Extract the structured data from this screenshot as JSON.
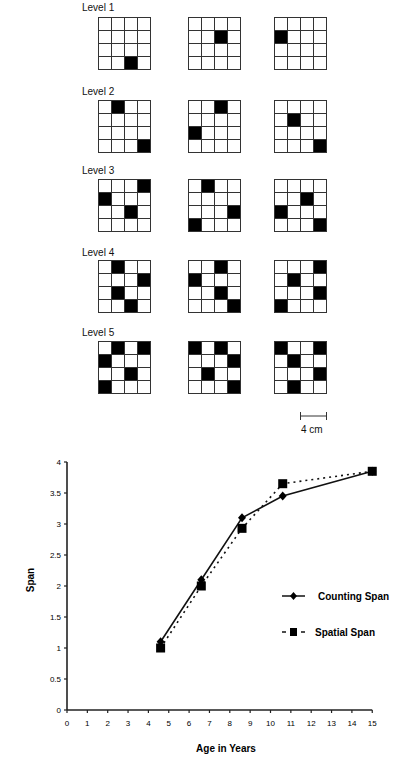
{
  "figure": {
    "grid_size": 4,
    "levels": [
      {
        "label": "Level  1",
        "label_y": 2,
        "grid_y": 17,
        "grids": [
          [
            [
              3,
              2
            ]
          ],
          [
            [
              1,
              2
            ]
          ],
          [
            [
              1,
              0
            ]
          ]
        ]
      },
      {
        "label": "Level  2",
        "label_y": 86,
        "grid_y": 100,
        "grids": [
          [
            [
              0,
              1
            ],
            [
              3,
              3
            ]
          ],
          [
            [
              0,
              2
            ],
            [
              2,
              0
            ]
          ],
          [
            [
              1,
              1
            ],
            [
              3,
              3
            ]
          ]
        ]
      },
      {
        "label": "Level  3",
        "label_y": 165,
        "grid_y": 179,
        "grids": [
          [
            [
              0,
              3
            ],
            [
              1,
              0
            ],
            [
              2,
              2
            ]
          ],
          [
            [
              0,
              1
            ],
            [
              2,
              3
            ],
            [
              3,
              0
            ]
          ],
          [
            [
              1,
              2
            ],
            [
              2,
              0
            ],
            [
              3,
              3
            ]
          ]
        ]
      },
      {
        "label": "Level  4",
        "label_y": 247,
        "grid_y": 260,
        "grids": [
          [
            [
              0,
              1
            ],
            [
              1,
              3
            ],
            [
              2,
              1
            ],
            [
              3,
              2
            ]
          ],
          [
            [
              0,
              2
            ],
            [
              1,
              0
            ],
            [
              2,
              2
            ],
            [
              3,
              3
            ]
          ],
          [
            [
              0,
              3
            ],
            [
              1,
              1
            ],
            [
              2,
              3
            ],
            [
              3,
              0
            ]
          ]
        ]
      },
      {
        "label": "Level  5",
        "label_y": 327,
        "grid_y": 341,
        "grids": [
          [
            [
              0,
              1
            ],
            [
              0,
              3
            ],
            [
              1,
              0
            ],
            [
              2,
              2
            ],
            [
              3,
              0
            ]
          ],
          [
            [
              0,
              0
            ],
            [
              0,
              2
            ],
            [
              1,
              3
            ],
            [
              2,
              1
            ],
            [
              3,
              3
            ]
          ],
          [
            [
              0,
              0
            ],
            [
              0,
              3
            ],
            [
              1,
              1
            ],
            [
              2,
              3
            ],
            [
              3,
              1
            ]
          ]
        ]
      }
    ],
    "grid_x": [
      98,
      188,
      274
    ],
    "scale_label": "4 cm"
  },
  "chart_data": {
    "type": "line",
    "title": "",
    "xlabel": "Age in Years",
    "ylabel": "Span",
    "xlim": [
      0,
      15
    ],
    "ylim": [
      0,
      4
    ],
    "x_ticks": [
      "0",
      "1",
      "2",
      "3",
      "4",
      "5",
      "6",
      "7",
      "8",
      "9",
      "10",
      "11",
      "12",
      "13",
      "14",
      "15"
    ],
    "y_ticks": [
      "0",
      "0.5",
      "1",
      "1.5",
      "2",
      "2.5",
      "3",
      "3.5",
      "4"
    ],
    "grid": false,
    "legend_position": "right-middle",
    "series": [
      {
        "name": "Counting Span",
        "marker": "diamond",
        "line": "solid",
        "x": [
          4.6,
          6.6,
          8.6,
          10.6,
          15
        ],
        "values": [
          1.1,
          2.1,
          3.1,
          3.45,
          3.85
        ]
      },
      {
        "name": "Spatial Span",
        "marker": "square",
        "line": "dashed",
        "x": [
          4.6,
          6.6,
          8.6,
          10.6,
          15
        ],
        "values": [
          1.0,
          2.0,
          2.93,
          3.65,
          3.85
        ]
      }
    ]
  },
  "legend": {
    "counting": "Counting Span",
    "spatial": "Spatial Span"
  }
}
